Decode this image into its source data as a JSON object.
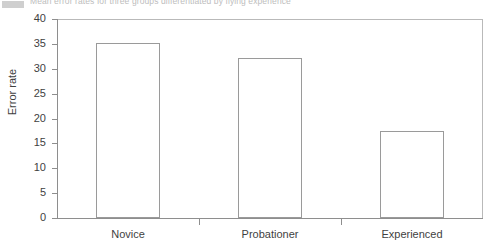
{
  "caption": {
    "text": "Mean error rates for three groups differentiated by flying experience",
    "marker": "caption-marker-box"
  },
  "chart_data": {
    "type": "bar",
    "title": "",
    "xlabel": "",
    "ylabel": "Error rate",
    "categories": [
      "Novice",
      "Probationer",
      "Experienced"
    ],
    "values": [
      35.2,
      32.2,
      17.4
    ],
    "ylim": [
      0,
      40
    ],
    "yticks": [
      0,
      5,
      10,
      15,
      20,
      25,
      30,
      35,
      40
    ],
    "ytick_labels": [
      "0",
      "5",
      "10",
      "15",
      "20",
      "25",
      "30",
      "35",
      "40"
    ],
    "grid": false,
    "legend": null,
    "bar_style": {
      "fill": "#ffffff",
      "edge": "#9a9a9a"
    },
    "axis_color": "#8e8e8e",
    "frame_color": "#b9b9b9"
  }
}
